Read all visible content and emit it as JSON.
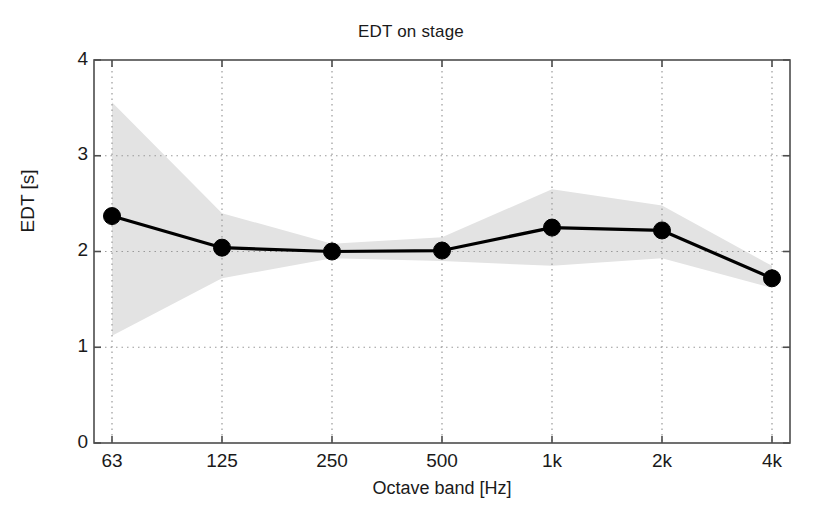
{
  "chart_data": {
    "type": "line",
    "title": "EDT on stage",
    "xlabel": "Octave band [Hz]",
    "ylabel": "EDT [s]",
    "categories": [
      "63",
      "125",
      "250",
      "500",
      "1k",
      "2k",
      "4k"
    ],
    "x_tick_labels": [
      "63",
      "125",
      "250",
      "500",
      "1k",
      "2k",
      "4k"
    ],
    "y_tick_labels": [
      "0",
      "1",
      "2",
      "3",
      "4"
    ],
    "y_ticks": [
      0,
      1,
      2,
      3,
      4
    ],
    "ylim": [
      0,
      4
    ],
    "grid": "dotted",
    "legend": "none",
    "series": [
      {
        "name": "EDT mean",
        "marker": "filled-circle",
        "color": "#000000",
        "values": [
          2.37,
          2.04,
          2.0,
          2.01,
          2.25,
          2.22,
          1.72
        ]
      }
    ],
    "shaded_band": {
      "name": "EDT spread",
      "color": "#e3e3e3",
      "upper": [
        3.56,
        2.4,
        2.08,
        2.15,
        2.65,
        2.48,
        1.85
      ],
      "lower": [
        1.12,
        1.72,
        1.93,
        1.9,
        1.85,
        1.93,
        1.62
      ]
    }
  },
  "figure": {
    "background_color": "#ffffff",
    "axis_color": "#4d4d4d",
    "grid_color": "#9a9a9a",
    "line_color": "#000000"
  }
}
